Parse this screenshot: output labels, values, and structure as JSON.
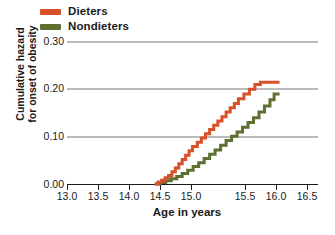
{
  "chart_data": {
    "type": "line",
    "subtype": "step",
    "title": "",
    "xlabel": "Age in years",
    "ylabel": "Cumulative hazard for onset of obesity",
    "xlim": [
      13.0,
      16.5
    ],
    "ylim": [
      0.0,
      0.3
    ],
    "xticks": [
      "13.0",
      "13.5",
      "14.0",
      "14.5",
      "15.0",
      "15.5",
      "16.0",
      "16.5"
    ],
    "yticks": [
      "0.00",
      "0.10",
      "0.20",
      "0.30"
    ],
    "grid": "horizontal",
    "legend_position": "top-left",
    "series": [
      {
        "name": "Dieters",
        "color": "#d8512a",
        "points": [
          [
            14.28,
            0.0
          ],
          [
            14.33,
            0.004
          ],
          [
            14.38,
            0.008
          ],
          [
            14.43,
            0.013
          ],
          [
            14.48,
            0.018
          ],
          [
            14.53,
            0.026
          ],
          [
            14.58,
            0.034
          ],
          [
            14.63,
            0.043
          ],
          [
            14.68,
            0.052
          ],
          [
            14.73,
            0.061
          ],
          [
            14.78,
            0.07
          ],
          [
            14.83,
            0.079
          ],
          [
            14.9,
            0.088
          ],
          [
            14.96,
            0.097
          ],
          [
            15.02,
            0.106
          ],
          [
            15.08,
            0.115
          ],
          [
            15.14,
            0.124
          ],
          [
            15.2,
            0.133
          ],
          [
            15.26,
            0.142
          ],
          [
            15.32,
            0.152
          ],
          [
            15.38,
            0.161
          ],
          [
            15.44,
            0.17
          ],
          [
            15.5,
            0.18
          ],
          [
            15.58,
            0.19
          ],
          [
            15.66,
            0.2
          ],
          [
            15.74,
            0.21
          ],
          [
            15.82,
            0.215
          ],
          [
            16.1,
            0.215
          ]
        ]
      },
      {
        "name": "Nondieters",
        "color": "#5d7031",
        "points": [
          [
            14.28,
            0.0
          ],
          [
            14.36,
            0.003
          ],
          [
            14.44,
            0.007
          ],
          [
            14.52,
            0.011
          ],
          [
            14.6,
            0.016
          ],
          [
            14.68,
            0.022
          ],
          [
            14.76,
            0.029
          ],
          [
            14.84,
            0.037
          ],
          [
            14.92,
            0.045
          ],
          [
            15.0,
            0.054
          ],
          [
            15.08,
            0.063
          ],
          [
            15.16,
            0.072
          ],
          [
            15.24,
            0.082
          ],
          [
            15.32,
            0.092
          ],
          [
            15.4,
            0.101
          ],
          [
            15.48,
            0.11
          ],
          [
            15.56,
            0.12
          ],
          [
            15.64,
            0.13
          ],
          [
            15.72,
            0.14
          ],
          [
            15.8,
            0.152
          ],
          [
            15.88,
            0.165
          ],
          [
            15.96,
            0.178
          ],
          [
            16.02,
            0.19
          ],
          [
            16.1,
            0.19
          ]
        ]
      }
    ]
  },
  "legend": {
    "items": [
      {
        "label": "Dieters",
        "color": "#d8512a"
      },
      {
        "label": "Nondieters",
        "color": "#5d7031"
      }
    ]
  },
  "axes": {
    "ylabel_line1": "Cumulative hazard",
    "ylabel_line2": "for onset of obesity",
    "xlabel": "Age in years",
    "yticks": [
      "0.30",
      "0.20",
      "0.10",
      "0.00"
    ],
    "xticks": [
      "13.0",
      "13.5",
      "14.0",
      "14.5",
      "15.0",
      "15.5",
      "16.0",
      "16.5"
    ]
  }
}
